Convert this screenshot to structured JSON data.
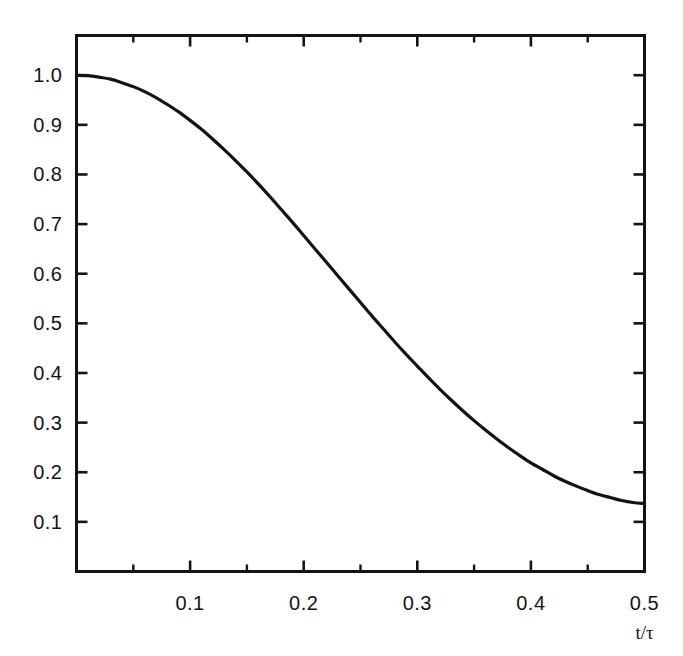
{
  "figure": {
    "background_color": "#ffffff",
    "line_color": "#141414",
    "axis_color": "#141414",
    "axis_title_x": "t/τ"
  },
  "chart_data": {
    "type": "line",
    "title": "",
    "subtitle": "",
    "xlabel": "t/τ",
    "ylabel": "",
    "xlim": [
      0.0,
      0.5
    ],
    "ylim": [
      0.0,
      1.08
    ],
    "grid": false,
    "legend": null,
    "legend_position": "none",
    "x_major_ticks": [
      0.1,
      0.2,
      0.3,
      0.4,
      0.5
    ],
    "x_tick_labels": [
      "0.1",
      "0.2",
      "0.3",
      "0.4",
      "0.5"
    ],
    "x_minor_ticks": [
      0.05,
      0.15,
      0.25,
      0.35,
      0.45
    ],
    "y_major_ticks": [
      0.1,
      0.2,
      0.3,
      0.4,
      0.5,
      0.6,
      0.7,
      0.8,
      0.9,
      1.0
    ],
    "y_tick_labels": [
      "0.1",
      "0.2",
      "0.3",
      "0.4",
      "0.5",
      "0.6",
      "0.7",
      "0.8",
      "0.9",
      "1.0"
    ],
    "series": [
      {
        "name": "curve",
        "x": [
          0.0,
          0.01,
          0.02,
          0.03,
          0.04,
          0.05,
          0.06,
          0.07,
          0.08,
          0.09,
          0.1,
          0.11,
          0.12,
          0.13,
          0.14,
          0.15,
          0.16,
          0.17,
          0.18,
          0.19,
          0.2,
          0.21,
          0.22,
          0.23,
          0.24,
          0.25,
          0.26,
          0.27,
          0.28,
          0.29,
          0.3,
          0.31,
          0.32,
          0.33,
          0.34,
          0.35,
          0.36,
          0.37,
          0.38,
          0.39,
          0.4,
          0.41,
          0.42,
          0.43,
          0.44,
          0.45,
          0.46,
          0.47,
          0.48,
          0.49,
          0.5
        ],
        "y": [
          1.0,
          0.999,
          0.996,
          0.992,
          0.985,
          0.977,
          0.967,
          0.955,
          0.941,
          0.926,
          0.909,
          0.891,
          0.871,
          0.85,
          0.828,
          0.805,
          0.781,
          0.756,
          0.73,
          0.704,
          0.677,
          0.65,
          0.623,
          0.596,
          0.569,
          0.542,
          0.515,
          0.489,
          0.463,
          0.438,
          0.414,
          0.39,
          0.367,
          0.345,
          0.324,
          0.304,
          0.285,
          0.267,
          0.25,
          0.234,
          0.219,
          0.206,
          0.193,
          0.182,
          0.172,
          0.163,
          0.155,
          0.149,
          0.143,
          0.139,
          0.137
        ]
      }
    ],
    "annotations": []
  }
}
